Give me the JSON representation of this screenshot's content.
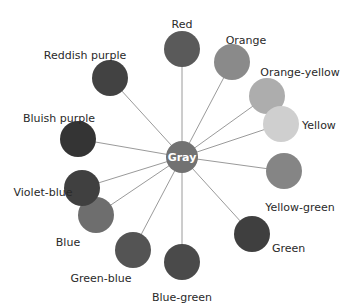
{
  "diagram": {
    "title": "",
    "center": {
      "label": "Gray",
      "x": 182,
      "y": 157,
      "r": 16,
      "color": "#727272"
    },
    "nodes": [
      {
        "label": "Red",
        "x": 182,
        "y": 49,
        "color": "#5a5a5a",
        "label_x": 182,
        "label_y": 24,
        "anchor": "middle"
      },
      {
        "label": "Orange",
        "x": 232,
        "y": 62,
        "color": "#8a8a8a",
        "label_x": 246,
        "label_y": 40,
        "anchor": "middle"
      },
      {
        "label": "Orange-yellow",
        "x": 267,
        "y": 96,
        "color": "#adadad",
        "label_x": 300,
        "label_y": 72,
        "anchor": "middle"
      },
      {
        "label": "Yellow",
        "x": 281,
        "y": 124,
        "color": "#cfcfcf",
        "label_x": 302,
        "label_y": 125,
        "anchor": "start"
      },
      {
        "label": "Yellow-green",
        "x": 284,
        "y": 171,
        "color": "#858585",
        "label_x": 300,
        "label_y": 207,
        "anchor": "middle"
      },
      {
        "label": "Green",
        "x": 252,
        "y": 234,
        "color": "#3f3f3f",
        "label_x": 272,
        "label_y": 248,
        "anchor": "start"
      },
      {
        "label": "Blue-green",
        "x": 182,
        "y": 262,
        "color": "#4a4a4a",
        "label_x": 182,
        "label_y": 297,
        "anchor": "middle"
      },
      {
        "label": "Green-blue",
        "x": 133,
        "y": 250,
        "color": "#545454",
        "label_x": 101,
        "label_y": 278,
        "anchor": "middle"
      },
      {
        "label": "Blue",
        "x": 96,
        "y": 215,
        "color": "#6e6e6e",
        "label_x": 68,
        "label_y": 242,
        "anchor": "middle"
      },
      {
        "label": "Violet-blue",
        "x": 82,
        "y": 188,
        "color": "#404040",
        "label_x": 43,
        "label_y": 192,
        "anchor": "middle"
      },
      {
        "label": "Bluish purple",
        "x": 78,
        "y": 139,
        "color": "#343434",
        "label_x": 59,
        "label_y": 118,
        "anchor": "middle"
      },
      {
        "label": "Reddish purple",
        "x": 110,
        "y": 78,
        "color": "#424242",
        "label_x": 85,
        "label_y": 55,
        "anchor": "middle"
      }
    ],
    "node_radius": 18,
    "spoke_color": "#9a9a9a"
  }
}
